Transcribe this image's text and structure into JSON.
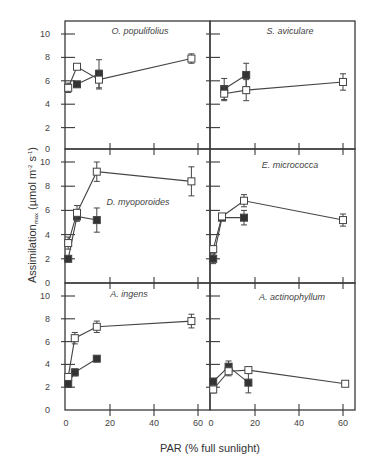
{
  "chart_data": {
    "type": "scatter",
    "layout": "3x2 panels with shared axes",
    "xlabel": "PAR (% full sunlight)",
    "ylabel": "Assimilation_max (µmol m-2 s-1)",
    "ylabel_main": "Assimilation",
    "ylabel_sub": "max",
    "ylabel_units": " (µmol m",
    "ylabel_exp1": "-2",
    "ylabel_mid": " s",
    "ylabel_exp2": "-1",
    "ylabel_end": ")",
    "xlim": [
      0,
      65
    ],
    "ylim": [
      0,
      11
    ],
    "xticks": [
      0,
      20,
      40,
      60
    ],
    "yticks": [
      0,
      2,
      4,
      6,
      8,
      10
    ],
    "legend": [
      {
        "name": "open squares",
        "marker": "open-square"
      },
      {
        "name": "filled squares",
        "marker": "filled-square"
      }
    ],
    "panels": [
      {
        "title": "O. populifolius",
        "row": 0,
        "col": 0,
        "series": [
          {
            "marker": "open-square",
            "points": [
              {
                "x": 1,
                "y": 5.4,
                "err": 0.4
              },
              {
                "x": 5,
                "y": 7.2,
                "err": 0
              },
              {
                "x": 15,
                "y": 6.1,
                "err": 0.8
              },
              {
                "x": 57,
                "y": 7.9,
                "err": 0.4
              }
            ]
          },
          {
            "marker": "filled-square",
            "points": [
              {
                "x": 5,
                "y": 5.7,
                "err": 0
              },
              {
                "x": 15,
                "y": 6.6,
                "err": 1.2
              }
            ]
          }
        ]
      },
      {
        "title": "S. aviculare",
        "row": 0,
        "col": 1,
        "series": [
          {
            "marker": "open-square",
            "points": [
              {
                "x": 6,
                "y": 4.9,
                "err": 0.6
              },
              {
                "x": 16,
                "y": 5.2,
                "err": 0.9
              },
              {
                "x": 60,
                "y": 5.9,
                "err": 0.7
              }
            ]
          },
          {
            "marker": "filled-square",
            "points": [
              {
                "x": 6,
                "y": 5.3,
                "err": 0.9
              },
              {
                "x": 16,
                "y": 6.5,
                "err": 1.0
              }
            ]
          }
        ]
      },
      {
        "title": "D. myoporoides",
        "row": 1,
        "col": 0,
        "series": [
          {
            "marker": "open-square",
            "points": [
              {
                "x": 1,
                "y": 3.3,
                "err": 0.5
              },
              {
                "x": 5,
                "y": 5.8,
                "err": 0.6
              },
              {
                "x": 14,
                "y": 9.2,
                "err": 0.8
              },
              {
                "x": 57,
                "y": 8.4,
                "err": 1.2
              }
            ]
          },
          {
            "marker": "filled-square",
            "points": [
              {
                "x": 1,
                "y": 2.0,
                "err": 0
              },
              {
                "x": 5,
                "y": 5.5,
                "err": 0.4
              },
              {
                "x": 14,
                "y": 5.2,
                "err": 1.0
              }
            ]
          }
        ]
      },
      {
        "title": "E. micrococca",
        "row": 1,
        "col": 1,
        "series": [
          {
            "marker": "open-square",
            "points": [
              {
                "x": 1,
                "y": 2.8,
                "err": 0.3
              },
              {
                "x": 5,
                "y": 5.5,
                "err": 0.2
              },
              {
                "x": 15,
                "y": 6.8,
                "err": 0.5
              },
              {
                "x": 60,
                "y": 5.2,
                "err": 0.5
              }
            ]
          },
          {
            "marker": "filled-square",
            "points": [
              {
                "x": 1,
                "y": 2.0,
                "err": 0.4
              },
              {
                "x": 5,
                "y": 5.4,
                "err": 0.2
              },
              {
                "x": 15,
                "y": 5.4,
                "err": 0.6
              }
            ]
          }
        ]
      },
      {
        "title": "A. ingens",
        "row": 2,
        "col": 0,
        "series": [
          {
            "marker": "open-square",
            "points": [
              {
                "x": 1,
                "y": 2.9,
                "err": 0.3
              },
              {
                "x": 4,
                "y": 6.3,
                "err": 0.5
              },
              {
                "x": 14,
                "y": 7.3,
                "err": 0.5
              },
              {
                "x": 57,
                "y": 7.8,
                "err": 0.6
              }
            ]
          },
          {
            "marker": "filled-square",
            "points": [
              {
                "x": 1,
                "y": 2.3,
                "err": 0.3
              },
              {
                "x": 4,
                "y": 3.3,
                "err": 0.3
              },
              {
                "x": 14,
                "y": 4.5,
                "err": 0
              }
            ]
          }
        ]
      },
      {
        "title": "A. actinophyllum",
        "row": 2,
        "col": 1,
        "series": [
          {
            "marker": "open-square",
            "points": [
              {
                "x": 1,
                "y": 1.8,
                "err": 0.3
              },
              {
                "x": 8,
                "y": 3.4,
                "err": 0.4
              },
              {
                "x": 17,
                "y": 3.5,
                "err": 0
              },
              {
                "x": 61,
                "y": 2.3,
                "err": 0
              }
            ]
          },
          {
            "marker": "filled-square",
            "points": [
              {
                "x": 1,
                "y": 2.5,
                "err": 0
              },
              {
                "x": 8,
                "y": 3.8,
                "err": 0.5
              },
              {
                "x": 17,
                "y": 2.4,
                "err": 0.9
              }
            ]
          }
        ]
      }
    ]
  },
  "colors": {
    "axis": "#3a3a3a",
    "line": "#444444",
    "open_marker_fill": "#ffffff",
    "filled_marker": "#333333",
    "background": "#ffffff"
  }
}
